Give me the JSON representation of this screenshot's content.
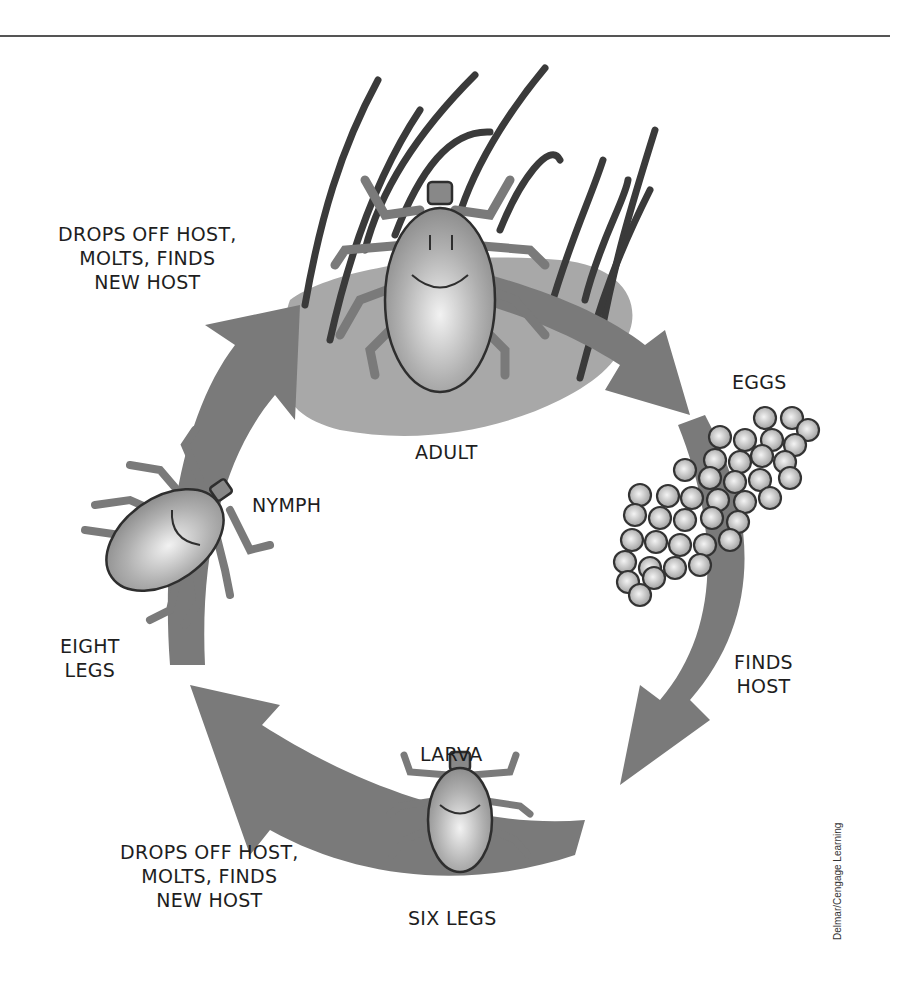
{
  "diagram": {
    "type": "life-cycle",
    "colors": {
      "arrow": "#7a7a7a",
      "skin_patch": "#a8a8a8",
      "hair": "#3a3a3a",
      "tick_body": "#b8b8b8",
      "tick_outline": "#2e2e2e",
      "egg": "#c4c4c4",
      "rule": "#555555"
    },
    "stages": [
      {
        "id": "adult",
        "label": "ADULT"
      },
      {
        "id": "eggs",
        "label": "EGGS"
      },
      {
        "id": "larva",
        "label": "LARVA",
        "note": "SIX LEGS"
      },
      {
        "id": "nymph",
        "label": "NYMPH",
        "note_lines": [
          "EIGHT",
          "LEGS"
        ]
      }
    ],
    "transitions": [
      {
        "from": "adult",
        "to": "eggs",
        "lines": []
      },
      {
        "from": "eggs",
        "to": "larva",
        "lines": [
          "FINDS",
          "HOST"
        ]
      },
      {
        "from": "larva",
        "to": "nymph",
        "lines": [
          "DROPS OFF HOST,",
          "MOLTS, FINDS",
          "NEW HOST"
        ]
      },
      {
        "from": "nymph",
        "to": "adult",
        "lines": [
          "DROPS OFF HOST,",
          "MOLTS, FINDS",
          "NEW HOST"
        ]
      }
    ],
    "credit": "Delmar/Cengage Learning"
  }
}
